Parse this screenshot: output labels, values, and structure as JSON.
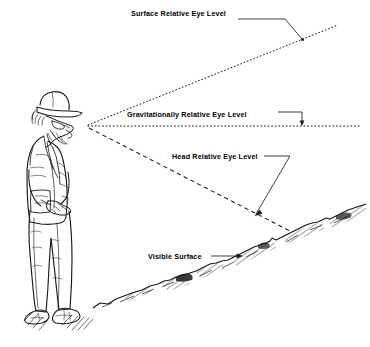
{
  "diagram": {
    "background_color": "#ffffff",
    "ink_color": "#000000",
    "labels": {
      "surface_relative": "Surface Relative Eye Level",
      "gravitationally_relative": "Gravitationally Relative Eye Level",
      "head_relative": "Head Relative Eye Level",
      "visible_surface": "Visible Surface"
    },
    "figure": {
      "name": "standing-man-with-cap-looking-down",
      "description": "Line drawing of a bearded man wearing a cap and glasses, hands clasped, looking down at the sloping ground"
    },
    "sight_lines": [
      {
        "name": "surface-relative-eye-level",
        "style": "dotted",
        "from": "eye",
        "direction": "upward to the right"
      },
      {
        "name": "gravitationally-relative-eye-level",
        "style": "dotted",
        "from": "eye",
        "direction": "horizontal to the right"
      },
      {
        "name": "head-relative-eye-level",
        "style": "dashed",
        "from": "eye",
        "direction": "downward to the right, meeting the ground"
      }
    ],
    "terrain": {
      "name": "visible-surface",
      "description": "Irregular hatched ground line rising from lower left to upper right"
    }
  }
}
